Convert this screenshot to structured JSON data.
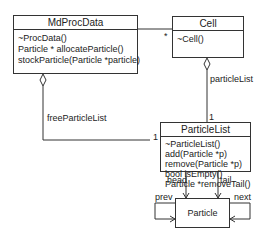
{
  "diagram": {
    "type": "uml-class",
    "classes": [
      {
        "name": "MdProcData",
        "operations": [
          "~ProcData()",
          "Particle * allocateParticle()",
          "stockParticle(Particle *particle)"
        ]
      },
      {
        "name": "Cell",
        "operations": [
          "~Cell()"
        ]
      },
      {
        "name": "ParticleList",
        "operations": [
          "~ParticleList()",
          "add(Particle *p)",
          "remove(Particle *p)",
          "bool isEmpty()",
          "Particle *removeTail()"
        ]
      },
      {
        "name": "Particle",
        "operations": []
      }
    ],
    "associations": [
      {
        "from": "MdProcData",
        "to": "Cell",
        "kind": "aggregation",
        "multiplicity": "*"
      },
      {
        "from": "Cell",
        "to": "ParticleList",
        "kind": "aggregation",
        "role": "particleList",
        "multiplicity": "1"
      },
      {
        "from": "MdProcData",
        "to": "ParticleList",
        "kind": "aggregation",
        "role": "freeParticleList",
        "multiplicity": "1"
      },
      {
        "from": "ParticleList",
        "to": "Particle",
        "kind": "association",
        "role": "head"
      },
      {
        "from": "ParticleList",
        "to": "Particle",
        "kind": "association",
        "role": "tail"
      },
      {
        "from": "Particle",
        "to": "Particle",
        "kind": "association",
        "role": "prev"
      },
      {
        "from": "Particle",
        "to": "Particle",
        "kind": "association",
        "role": "next"
      }
    ]
  },
  "labels": {
    "star": "*",
    "particleList": "particleList",
    "one_top": "1",
    "freeParticleList": "freeParticleList",
    "one_left": "1",
    "head": "head",
    "tail": "tail",
    "prev": "prev",
    "next": "next"
  }
}
